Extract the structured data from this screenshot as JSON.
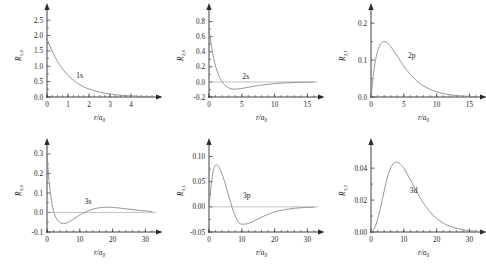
{
  "figure": {
    "title": "",
    "rows": 2,
    "cols": 3,
    "curve_color": "#8a8a8a",
    "axis_color": "#2b2b2b"
  },
  "chart_data": [
    {
      "type": "line",
      "id": "1s",
      "title": "",
      "curve_label": "1s",
      "xlabel": "r/a",
      "xlabel_sub": "0",
      "ylabel": "R",
      "ylabel_sub": "1,0",
      "xlim": [
        0,
        5
      ],
      "ylim": [
        0,
        2.7
      ],
      "xticks": [
        0,
        1,
        2,
        3,
        4
      ],
      "xticklabels": [
        "0",
        "1",
        "2",
        "3",
        "4"
      ],
      "yticks": [
        0.0,
        0.5,
        1.0,
        1.5,
        2.0,
        2.5
      ],
      "yticklabels": [
        "0.0",
        "0.5",
        "1.0",
        "1.5",
        "2.0",
        "2.5"
      ],
      "minor_x_step": 0.25,
      "grid": false,
      "formula": "2*exp(-r)",
      "x": [
        0,
        0.2,
        0.4,
        0.6,
        0.8,
        1.0,
        1.25,
        1.5,
        1.75,
        2.0,
        2.5,
        3.0,
        3.5,
        4.0,
        4.5,
        5.0
      ],
      "y": [
        1.9,
        1.56,
        1.28,
        1.05,
        0.86,
        0.7,
        0.55,
        0.43,
        0.33,
        0.26,
        0.16,
        0.095,
        0.058,
        0.035,
        0.021,
        0.013
      ],
      "label_pos": [
        1.55,
        0.62
      ]
    },
    {
      "type": "line",
      "id": "2s",
      "title": "",
      "curve_label": "2s",
      "xlabel": "r/a",
      "xlabel_sub": "0",
      "ylabel": "R",
      "ylabel_sub": "2,0",
      "xlim": [
        0,
        16
      ],
      "ylim": [
        -0.2,
        0.9
      ],
      "xticks": [
        0,
        5,
        10,
        15
      ],
      "xticklabels": [
        "0",
        "5",
        "10",
        "15"
      ],
      "yticks": [
        -0.2,
        0.0,
        0.2,
        0.4,
        0.6,
        0.8
      ],
      "yticklabels": [
        "-0.2",
        "0.0",
        "0.2",
        "0.4",
        "0.6",
        "0.8"
      ],
      "minor_x_step": 1,
      "grid": false,
      "formula": "(1/(2*sqrt(2)))*(2-r)*exp(-r/2)",
      "x": [
        0,
        0.5,
        1.0,
        1.5,
        2.0,
        2.5,
        3.0,
        3.5,
        4.0,
        5.0,
        6.0,
        7.0,
        8.0,
        10.0,
        12.0,
        14.0,
        16.0
      ],
      "y": [
        0.7,
        0.41,
        0.21,
        0.084,
        0.0,
        -0.05,
        -0.079,
        -0.093,
        -0.096,
        -0.087,
        -0.071,
        -0.055,
        -0.042,
        -0.022,
        -0.011,
        -0.005,
        -0.002
      ],
      "label_pos": [
        5.6,
        0.035
      ]
    },
    {
      "type": "line",
      "id": "2p",
      "title": "",
      "curve_label": "2p",
      "xlabel": "r/a",
      "xlabel_sub": "0",
      "ylabel": "R",
      "ylabel_sub": "2,1",
      "xlim": [
        0,
        16
      ],
      "ylim": [
        0,
        0.225
      ],
      "xticks": [
        0,
        5,
        10,
        15
      ],
      "xticklabels": [
        "0",
        "5",
        "10",
        "15"
      ],
      "yticks": [
        0.0,
        0.1,
        0.2
      ],
      "yticklabels": [
        "0.0",
        "0.1",
        "0.2"
      ],
      "minor_x_step": 1,
      "grid": false,
      "formula": "(1/(2*sqrt(6)))*r*exp(-r/2)",
      "x": [
        0,
        0.5,
        1.0,
        1.5,
        2.0,
        2.5,
        3.0,
        4.0,
        5.0,
        6.0,
        7.0,
        8.0,
        10.0,
        12.0,
        14.0,
        16.0
      ],
      "y": [
        0.0,
        0.0795,
        0.1238,
        0.1447,
        0.1502,
        0.1462,
        0.1367,
        0.1105,
        0.0838,
        0.061,
        0.0431,
        0.0299,
        0.0138,
        0.0061,
        0.0026,
        0.0011
      ],
      "label_pos": [
        6.2,
        0.105
      ]
    },
    {
      "type": "line",
      "id": "3s",
      "title": "",
      "curve_label": "3s",
      "xlabel": "r/a",
      "xlabel_sub": "0",
      "ylabel": "R",
      "ylabel_sub": "3,0",
      "xlim": [
        0,
        32
      ],
      "ylim": [
        -0.1,
        0.325
      ],
      "xticks": [
        0,
        10,
        20,
        30
      ],
      "xticklabels": [
        "0",
        "10",
        "20",
        "30"
      ],
      "yticks": [
        -0.1,
        0.0,
        0.1,
        0.2,
        0.3
      ],
      "yticklabels": [
        "-0.1",
        "0.0",
        "0.1",
        "0.2",
        "0.3"
      ],
      "minor_x_step": 2,
      "grid": false,
      "formula": "(2/(81*sqrt(3)))*(27-18*r+2*r*r)*exp(-r/3)",
      "x": [
        0,
        0.5,
        1.0,
        1.5,
        2.0,
        2.5,
        3.0,
        4.0,
        5.0,
        6.0,
        7.0,
        8.0,
        9.0,
        10.0,
        12.0,
        14.0,
        16.0,
        18.0,
        20.0,
        24.0,
        28.0,
        32.0
      ],
      "y": [
        0.3,
        0.185,
        0.105,
        0.047,
        0.008,
        -0.018,
        -0.035,
        -0.052,
        -0.057,
        -0.054,
        -0.046,
        -0.035,
        -0.024,
        -0.013,
        0.005,
        0.017,
        0.024,
        0.027,
        0.026,
        0.019,
        0.011,
        0.005
      ],
      "label_pos": [
        12.5,
        0.045
      ]
    },
    {
      "type": "line",
      "id": "3p",
      "title": "",
      "curve_label": "3p",
      "xlabel": "r/a",
      "xlabel_sub": "0",
      "ylabel": "R",
      "ylabel_sub": "3,1",
      "xlim": [
        0,
        32
      ],
      "ylim": [
        -0.05,
        0.115
      ],
      "xticks": [
        0,
        10,
        20,
        30
      ],
      "xticklabels": [
        "0",
        "10",
        "20",
        "30"
      ],
      "yticks": [
        -0.05,
        0.0,
        0.05,
        0.1
      ],
      "yticklabels": [
        "-0.05",
        "0.00",
        "0.05",
        "0.10"
      ],
      "minor_x_step": 2,
      "grid": false,
      "formula": "(4/(81*sqrt(6)))*(6-r)*r*exp(-r/3)",
      "x": [
        0,
        0.5,
        1.0,
        1.5,
        2.0,
        2.5,
        3.0,
        4.0,
        5.0,
        6.0,
        7.0,
        8.0,
        9.0,
        10.0,
        12.0,
        14.0,
        16.0,
        18.0,
        20.0,
        24.0,
        28.0,
        32.0
      ],
      "y": [
        0.0,
        0.0345,
        0.0605,
        0.076,
        0.0826,
        0.0831,
        0.0795,
        0.0651,
        0.0443,
        0.0216,
        0.0,
        -0.0184,
        -0.0306,
        -0.0345,
        -0.033,
        -0.027,
        -0.0205,
        -0.0148,
        -0.0102,
        -0.0045,
        -0.0018,
        -0.0007
      ],
      "label_pos": [
        11.5,
        0.017
      ]
    },
    {
      "type": "line",
      "id": "3d",
      "title": "",
      "curve_label": "3d",
      "xlabel": "r/a",
      "xlabel_sub": "0",
      "ylabel": "R",
      "ylabel_sub": "3,2",
      "xlim": [
        0,
        32
      ],
      "ylim": [
        0,
        0.052
      ],
      "xticks": [
        0,
        10,
        20,
        30
      ],
      "xticklabels": [
        "0",
        "10",
        "20",
        "30"
      ],
      "yticks": [
        0.0,
        0.02,
        0.04
      ],
      "yticklabels": [
        "0.00",
        "0.02",
        "0.04"
      ],
      "minor_x_step": 2,
      "grid": false,
      "formula": "(4/(81*sqrt(30)))*r*r*exp(-r/3)",
      "x": [
        0,
        1.0,
        2.0,
        3.0,
        4.0,
        5.0,
        6.0,
        7.0,
        8.0,
        9.0,
        10.0,
        12.0,
        14.0,
        16.0,
        18.0,
        20.0,
        22.0,
        24.0,
        28.0,
        32.0
      ],
      "y": [
        0.0,
        0.0021,
        0.0079,
        0.0161,
        0.0256,
        0.0344,
        0.0403,
        0.0432,
        0.0437,
        0.0424,
        0.0399,
        0.0327,
        0.0249,
        0.0181,
        0.0126,
        0.0085,
        0.0056,
        0.0036,
        0.0014,
        0.0005
      ],
      "label_pos": [
        13.0,
        0.0245
      ]
    }
  ]
}
